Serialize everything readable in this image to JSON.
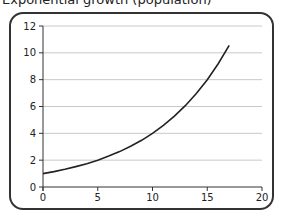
{
  "title": "Exponential growth (population)",
  "colors": {
    "frame": "#333333",
    "grid": "#c8c8c8",
    "axis": "#333333",
    "curve": "#222222"
  },
  "chart_data": {
    "type": "line",
    "title": "Exponential growth (population)",
    "xlabel": "",
    "ylabel": "",
    "xlim": [
      0,
      20
    ],
    "ylim": [
      0,
      12
    ],
    "x_ticks": [
      0,
      5,
      10,
      15,
      20
    ],
    "y_ticks": [
      0,
      2,
      4,
      6,
      8,
      10,
      12
    ],
    "grid": {
      "horizontal": true,
      "vertical": false
    },
    "legend": null,
    "series": [
      {
        "name": "y = 2^(x/5)",
        "x": [
          0,
          1,
          2,
          3,
          4,
          5,
          6,
          7,
          8,
          9,
          10,
          11,
          12,
          13,
          14,
          15,
          16,
          17
        ],
        "values": [
          1.0,
          1.15,
          1.32,
          1.52,
          1.74,
          2.0,
          2.3,
          2.64,
          3.03,
          3.48,
          4.0,
          4.59,
          5.28,
          6.06,
          6.96,
          8.0,
          9.19,
          10.56
        ]
      }
    ]
  }
}
